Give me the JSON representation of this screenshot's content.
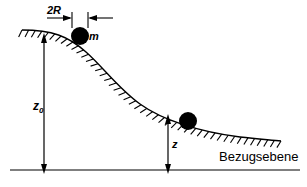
{
  "figure": {
    "kind": "physics-diagram",
    "background_color": "#ffffff",
    "line_color": "#000000",
    "ball_color": "#000000"
  },
  "labels": {
    "diameter": "2R",
    "mass": "m",
    "height_initial": "z",
    "height_initial_sub": "0",
    "height_current": "z",
    "baseline": "Bezugsebene"
  },
  "geometry": {
    "canvas": {
      "width": 307,
      "height": 187
    },
    "baseline": {
      "x1": 10,
      "x2": 300,
      "y": 170
    },
    "slope_curve": {
      "start": {
        "x": 22,
        "y": 30
      },
      "end": {
        "x": 281,
        "y": 141
      },
      "control_points": [
        {
          "x": 70,
          "y": 33
        },
        {
          "x": 120,
          "y": 82
        },
        {
          "x": 160,
          "y": 112
        },
        {
          "x": 215,
          "y": 133
        }
      ],
      "hatch_side": "below",
      "hatch_count": 44,
      "hatch_length": 8
    },
    "ball_top": {
      "cx": 80,
      "cy": 36,
      "r": 9
    },
    "ball_lower": {
      "cx": 188,
      "cy": 121,
      "r": 9
    },
    "dimension_2R": {
      "y": 18,
      "left_tick_x": 72,
      "right_tick_x": 88,
      "tick_top": 12,
      "tick_bottom": 26,
      "left_lead_x": 47,
      "right_lead_x": 113
    },
    "arrow_z0": {
      "x": 44,
      "y_top": 37,
      "y_bottom": 170
    },
    "arrow_z": {
      "x": 168,
      "y_top": 118,
      "y_bottom": 170
    }
  }
}
